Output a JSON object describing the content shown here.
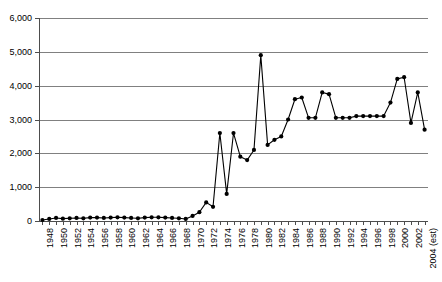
{
  "chart_data": {
    "type": "line",
    "title": "",
    "subtitle": "",
    "xlabel": "",
    "ylabel": "",
    "ylim": [
      0,
      6000
    ],
    "y_ticks": [
      0,
      1000,
      2000,
      3000,
      4000,
      5000,
      6000
    ],
    "y_tick_labels": [
      "0",
      "1,000",
      "2,000",
      "3,000",
      "4,000",
      "5,000",
      "6,000"
    ],
    "grid": true,
    "legend": "none",
    "marker": "filled-circle",
    "series_color": "#000000",
    "gridline_color": "#808080",
    "axis_color": "#4d4d4d",
    "x_tick_label_rotation": -90,
    "x_tick_label_interval": 2,
    "categories": [
      "1948",
      "1949",
      "1950",
      "1951",
      "1952",
      "1953",
      "1954",
      "1955",
      "1956",
      "1957",
      "1958",
      "1959",
      "1960",
      "1961",
      "1962",
      "1963",
      "1964",
      "1965",
      "1966",
      "1967",
      "1968",
      "1969",
      "1970",
      "1971",
      "1972",
      "1973",
      "1974",
      "1975",
      "1976",
      "1977",
      "1978",
      "1979",
      "1980",
      "1981",
      "1982",
      "1983",
      "1984",
      "1985",
      "1986",
      "1987",
      "1988",
      "1989",
      "1990",
      "1991",
      "1992",
      "1993",
      "1994",
      "1995",
      "1996",
      "1997",
      "1998",
      "1999",
      "2000",
      "2001",
      "2002",
      "2003",
      "2004 (est)"
    ],
    "x_tick_labels_shown": [
      "1948",
      "1950",
      "1952",
      "1954",
      "1956",
      "1958",
      "1960",
      "1962",
      "1964",
      "1966",
      "1968",
      "1970",
      "1972",
      "1974",
      "1976",
      "1978",
      "1980",
      "1982",
      "1984",
      "1986",
      "1988",
      "1990",
      "1992",
      "1994",
      "1996",
      "1998",
      "2000",
      "2002",
      "2004 (est)"
    ],
    "values": [
      30,
      60,
      90,
      70,
      80,
      90,
      80,
      100,
      100,
      90,
      100,
      110,
      100,
      90,
      80,
      100,
      110,
      110,
      100,
      90,
      80,
      60,
      150,
      260,
      550,
      420,
      2600,
      800,
      2600,
      1900,
      1800,
      2100,
      4900,
      2250,
      2400,
      2500,
      3000,
      3600,
      3650,
      3050,
      3050,
      3800,
      3750,
      3050,
      3050,
      3050,
      3100,
      3100,
      3100,
      3100,
      3100,
      3500,
      4200,
      4250,
      2900,
      3800,
      2700
    ]
  }
}
